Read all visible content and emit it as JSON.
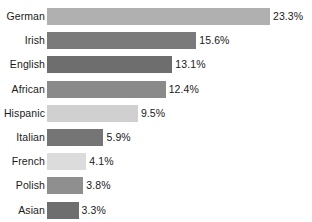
{
  "chart_data": {
    "type": "bar",
    "orientation": "horizontal",
    "title": "",
    "subtitle": "",
    "xlabel": "",
    "ylabel": "",
    "grid": false,
    "legend": null,
    "xlim": [
      0,
      23.3
    ],
    "categories": [
      "German",
      "Irish",
      "English",
      "African",
      "Hispanic",
      "Italian",
      "French",
      "Polish",
      "Asian"
    ],
    "values": [
      23.3,
      15.6,
      13.1,
      12.4,
      9.5,
      5.9,
      4.1,
      3.8,
      3.3
    ],
    "value_labels": [
      "23.3%",
      "15.6%",
      "13.1%",
      "12.4%",
      "9.5%",
      "5.9%",
      "4.1%",
      "3.8%",
      "3.3%"
    ],
    "bar_colors": [
      "#b0b0b0",
      "#7a7a7a",
      "#6e6e6e",
      "#8a8a8a",
      "#d0d0d0",
      "#757575",
      "#dcdcdc",
      "#8f8f8f",
      "#6e6e6e"
    ],
    "background_color": "#ffffff",
    "text_color": "#1a1a1a"
  }
}
